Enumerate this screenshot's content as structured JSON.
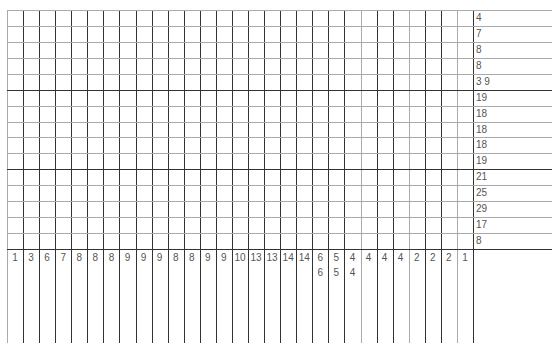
{
  "puzzle": {
    "type": "nonogram",
    "columns": 29,
    "rows": 15,
    "row_clues": [
      [
        4
      ],
      [
        7
      ],
      [
        8
      ],
      [
        8
      ],
      [
        3,
        9
      ],
      [
        19
      ],
      [
        18
      ],
      [
        18
      ],
      [
        18
      ],
      [
        19
      ],
      [
        21
      ],
      [
        25
      ],
      [
        29
      ],
      [
        17
      ],
      [
        8
      ]
    ],
    "column_clues": [
      [
        1
      ],
      [
        3
      ],
      [
        6
      ],
      [
        7
      ],
      [
        8
      ],
      [
        8
      ],
      [
        8
      ],
      [
        9
      ],
      [
        9
      ],
      [
        9
      ],
      [
        8
      ],
      [
        8
      ],
      [
        9
      ],
      [
        9
      ],
      [
        10
      ],
      [
        13
      ],
      [
        13
      ],
      [
        14
      ],
      [
        14
      ],
      [
        6,
        6
      ],
      [
        5,
        5
      ],
      [
        4,
        4
      ],
      [
        4
      ],
      [
        4
      ],
      [
        4
      ],
      [
        2
      ],
      [
        2
      ],
      [
        2
      ],
      [
        1
      ]
    ],
    "colors": {
      "line_dark": "#333333",
      "line_light": "#aaaaaa",
      "clue_text": "#555555",
      "background": "#ffffff"
    }
  }
}
